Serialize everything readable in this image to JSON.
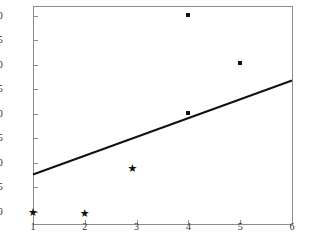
{
  "chart_data": {
    "type": "scatter",
    "title": "",
    "subtitle": "",
    "xlabel": "",
    "ylabel": "",
    "xlim": [
      1,
      6
    ],
    "ylim": [
      0.75,
      5.2
    ],
    "grid": false,
    "legend": false,
    "x_ticks": [
      "1",
      "2",
      "3",
      "4",
      "5",
      "6"
    ],
    "x_tick_values": [
      1,
      2,
      3,
      4,
      5,
      6
    ],
    "y_ticks": [
      "1.0",
      "1.5",
      "2.0",
      "2.5",
      "3.0",
      "3.5",
      "4.0",
      "4.5",
      "5.0"
    ],
    "y_tick_values": [
      1.0,
      1.5,
      2.0,
      2.5,
      3.0,
      3.5,
      4.0,
      4.5,
      5.0
    ],
    "series": [
      {
        "name": "star-points",
        "marker": "star",
        "color": "#111111",
        "points": [
          {
            "x": 1.0,
            "y": 0.98
          },
          {
            "x": 2.0,
            "y": 0.96
          },
          {
            "x": 2.92,
            "y": 1.89
          }
        ]
      },
      {
        "name": "dot-points",
        "marker": "square-dot",
        "color": "#111111",
        "points": [
          {
            "x": 4.0,
            "y": 3.02
          },
          {
            "x": 4.0,
            "y": 5.02
          },
          {
            "x": 5.0,
            "y": 4.03
          }
        ]
      }
    ],
    "trend_line": {
      "name": "regression-line",
      "color": "#111111",
      "width": 2,
      "x_start": 1.0,
      "y_start": 1.76,
      "x_end": 6.0,
      "y_end": 3.68
    },
    "axis_color": "#8c8c8c",
    "background_color": "#ffffff"
  }
}
